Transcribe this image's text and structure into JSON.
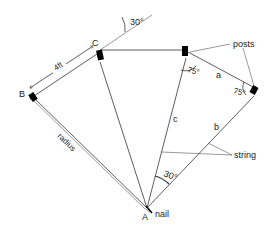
{
  "diagram": {
    "title": "",
    "points": {
      "A": "A",
      "B": "B",
      "C": "C"
    },
    "labels": {
      "distance_bc": "4ft",
      "radius": "radius",
      "segment_a": "a",
      "segment_b": "b",
      "segment_c": "c",
      "posts": "posts",
      "string": "string",
      "nail": "nail"
    },
    "angles": {
      "top_angle": "30°",
      "post_angle_1": "75°",
      "post_angle_2": "75°",
      "apex_angle": "30°"
    }
  }
}
